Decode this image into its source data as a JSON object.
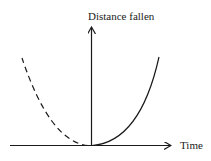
{
  "diagram": {
    "y_axis_label": "Distance fallen",
    "x_axis_label": "Time",
    "curves": [
      {
        "name": "solid-parabola-branch",
        "style": "solid",
        "description": "distance vs time for t >= 0"
      },
      {
        "name": "dashed-parabola-branch",
        "style": "dashed",
        "description": "mirror branch for t < 0"
      }
    ],
    "colors": {
      "stroke": "#1a1a1a",
      "background": "#ffffff"
    }
  }
}
